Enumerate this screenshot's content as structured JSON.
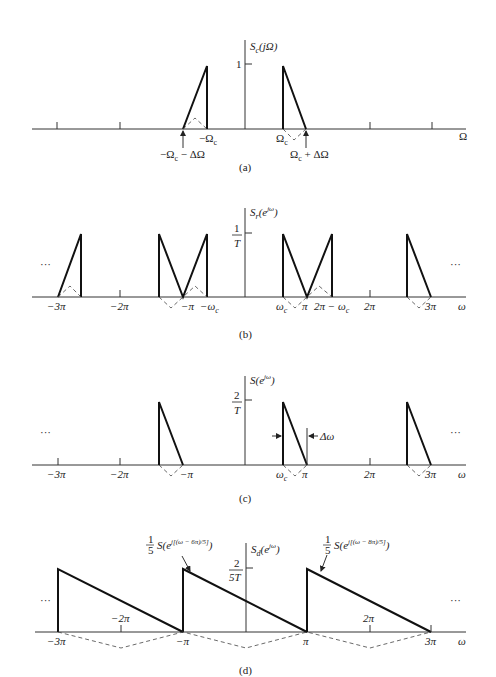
{
  "panels": [
    {
      "id": "a",
      "caption": "(a)",
      "ylabel": "S_c(jΩ)",
      "ylabel_main": "S",
      "ylabel_sub": "c",
      "ylabel_rest": "(jΩ)",
      "ytick": "1",
      "xlabel": "Ω",
      "xticks": {
        "neg_wc": "−Ω",
        "wc": "Ω",
        "sub": "c",
        "neg_edge": "−Ω",
        "neg_edge_rest": " − ΔΩ",
        "pos_edge": "Ω",
        "pos_edge_rest": " + ΔΩ"
      }
    },
    {
      "id": "b",
      "caption": "(b)",
      "ylabel_main": "S",
      "ylabel_sub": "r",
      "ylabel_rest": "(e",
      "ylabel_sup": "jω",
      "ylabel_close": ")",
      "ytick_num": "1",
      "ytick_den": "T",
      "xlabel": "ω",
      "ellipsis": "···",
      "xticks": [
        "−3π",
        "−2π",
        "−π",
        "−ω",
        "ω",
        "π",
        "2π − ω",
        "2π",
        "3π"
      ],
      "sub": "c"
    },
    {
      "id": "c",
      "caption": "(c)",
      "ylabel_main": "S(e",
      "ylabel_sup": "jω",
      "ylabel_close": ")",
      "ytick_num": "2",
      "ytick_den": "T",
      "xlabel": "ω",
      "ellipsis": "···",
      "delta_label": "Δω",
      "xticks": [
        "−3π",
        "−2π",
        "−π",
        "ω",
        "π",
        "2π",
        "3π"
      ],
      "sub": "c"
    },
    {
      "id": "d",
      "caption": "(d)",
      "ylabel_main": "S",
      "ylabel_sub": "d",
      "ylabel_rest": "(e",
      "ylabel_sup": "jω",
      "ylabel_close": ")",
      "ytick_num": "2",
      "ytick_den": "5T",
      "xlabel": "ω",
      "ellipsis": "···",
      "annot1_frac_num": "1",
      "annot1_frac_den": "5",
      "annot1_main": "S(e",
      "annot1_sup": "j[(ω − 6π)/5]",
      "annot1_close": ")",
      "annot2_frac_num": "1",
      "annot2_frac_den": "5",
      "annot2_main": "S(e",
      "annot2_sup": "j[(ω − 8π)/5]",
      "annot2_close": ")",
      "xticks": [
        "−3π",
        "−2π",
        "−π",
        "π",
        "2π",
        "3π"
      ]
    }
  ]
}
